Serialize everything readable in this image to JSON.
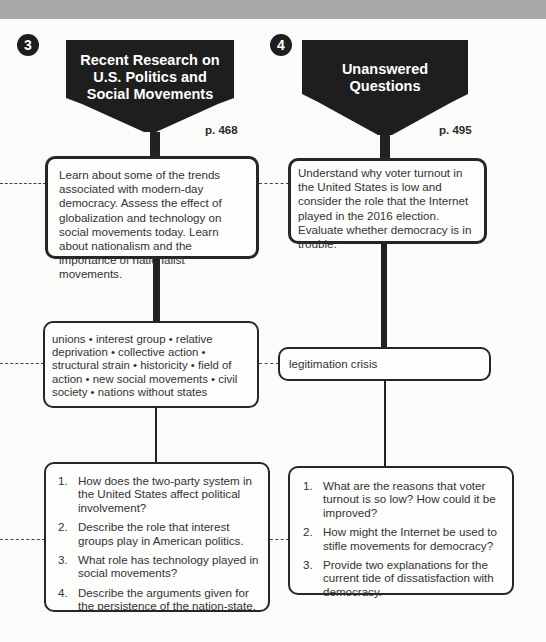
{
  "sections": [
    {
      "number": "3",
      "title_lines": [
        "Recent Research on",
        "U.S. Politics and",
        "Social Movements"
      ],
      "page": "p. 468",
      "objectives": "Learn about some of the trends associated with modern-day democracy. Assess the effect of globalization and technology on social movements today. Learn about nationalism and the importance of nationalist movements.",
      "key_terms": "unions • interest group • relative deprivation • collective action • structural strain • historicity • field of action • new social movements • civil society • nations without states",
      "questions": [
        {
          "num": "1.",
          "text": "How does the two-party system in the United States affect political involvement?"
        },
        {
          "num": "2.",
          "text": "Describe the role that interest groups play in American politics."
        },
        {
          "num": "3.",
          "text": "What role has technology played in social movements?"
        },
        {
          "num": "4.",
          "text": "Describe the arguments given for the persistence of the nation-state."
        }
      ]
    },
    {
      "number": "4",
      "title_lines": [
        "Unanswered",
        "Questions"
      ],
      "page": "p. 495",
      "objectives": "Understand why voter turnout in the United States is low and consider the role that the Internet played in the 2016 election. Evaluate whether democracy is in trouble.",
      "key_terms": "legitimation crisis",
      "questions": [
        {
          "num": "1.",
          "text": "What are the reasons that voter turnout is so low? How could it be improved?"
        },
        {
          "num": "2.",
          "text": "How might the Internet be used to stifle movements for democracy?"
        },
        {
          "num": "3.",
          "text": "Provide two explanations for the current tide of dissatisfaction with democracy."
        }
      ]
    }
  ],
  "colors": {
    "banner": "#1e1e1e",
    "band": "#a9a9a9",
    "border": "#262626"
  }
}
